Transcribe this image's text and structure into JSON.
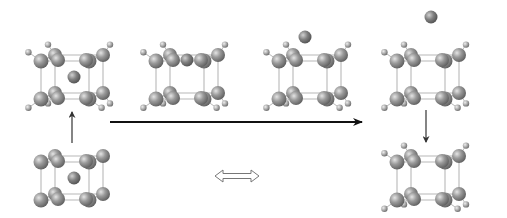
{
  "diagram": {
    "width": 507,
    "height": 218,
    "colors": {
      "background": "#ffffff",
      "atom_large": "#8a8a8a",
      "atom_large_highlight": "#d8d8d8",
      "atom_small": "#9a9a9a",
      "atom_small_highlight": "#e0e0e0",
      "bond": "#b8b8b8",
      "arrow": "#111111",
      "double_arrow": "#777777",
      "thin_arrow": "#333333"
    },
    "molecules": [
      {
        "id": "top-1",
        "cx": 72,
        "cy": 77,
        "cage": "expanded",
        "ion": "center"
      },
      {
        "id": "top-2",
        "cx": 187,
        "cy": 77,
        "cage": "planar",
        "ion": "edge-top"
      },
      {
        "id": "top-3",
        "cx": 310,
        "cy": 77,
        "cage": "compact",
        "ion": "above"
      },
      {
        "id": "top-4",
        "cx": 428,
        "cy": 77,
        "cage": "compact",
        "ion": "far-above"
      },
      {
        "id": "bottom-left",
        "cx": 72,
        "cy": 178,
        "cage": "bare",
        "ion": "center"
      },
      {
        "id": "bottom-right",
        "cx": 428,
        "cy": 178,
        "cage": "compact",
        "ion": "none"
      }
    ],
    "arrows": [
      {
        "id": "main-reaction-arrow",
        "type": "solid",
        "x1": 110,
        "y1": 122,
        "x2": 362,
        "y2": 122
      },
      {
        "id": "up-arrow-left",
        "type": "thin",
        "x1": 72,
        "y1": 143,
        "x2": 72,
        "y2": 112
      },
      {
        "id": "down-arrow-right",
        "type": "thin",
        "x1": 426,
        "y1": 110,
        "x2": 426,
        "y2": 142
      },
      {
        "id": "resonance-double-arrow",
        "type": "double",
        "x1": 215,
        "y1": 176,
        "x2": 259,
        "y2": 176
      }
    ]
  }
}
